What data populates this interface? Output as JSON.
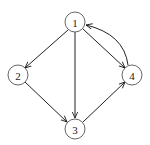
{
  "diagram": {
    "type": "directed-graph",
    "nodes": [
      {
        "id": "1",
        "label": "1",
        "x": 75,
        "y": 22
      },
      {
        "id": "2",
        "label": "2",
        "x": 18,
        "y": 75
      },
      {
        "id": "3",
        "label": "3",
        "x": 75,
        "y": 129
      },
      {
        "id": "4",
        "label": "4",
        "x": 132,
        "y": 75
      }
    ],
    "edges": [
      {
        "from": "1",
        "to": "2",
        "curved": false
      },
      {
        "from": "1",
        "to": "3",
        "curved": false
      },
      {
        "from": "1",
        "to": "4",
        "curved": false
      },
      {
        "from": "2",
        "to": "3",
        "curved": false
      },
      {
        "from": "3",
        "to": "4",
        "curved": false
      },
      {
        "from": "4",
        "to": "1",
        "curved": true
      }
    ],
    "colors": {
      "stroke": "#222222",
      "node_border": "#555555",
      "background": "#ffffff"
    }
  }
}
